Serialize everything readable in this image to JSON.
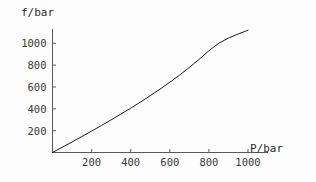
{
  "chart_data": {
    "type": "line",
    "title": "",
    "subtitle": "",
    "xlabel": "P/bar",
    "ylabel": "f/bar",
    "xlim": [
      0,
      1030
    ],
    "ylim": [
      0,
      1150
    ],
    "xticks": [
      200,
      400,
      600,
      800,
      1000
    ],
    "yticks": [
      200,
      400,
      600,
      800,
      1000
    ],
    "xtick_labels": [
      "200",
      "400",
      "600",
      "800",
      "1000"
    ],
    "ytick_labels": [
      "200",
      "400",
      "600",
      "800",
      "1000"
    ],
    "grid": false,
    "legend": null,
    "legend_position": "none",
    "annotations": [],
    "series": [
      {
        "name": "fugacity",
        "color": "#1a1a1a",
        "line_width": 1,
        "x": [
          0,
          50,
          100,
          150,
          200,
          250,
          300,
          350,
          400,
          450,
          500,
          550,
          600,
          650,
          700,
          750,
          800,
          850,
          900,
          950,
          1000
        ],
        "y": [
          0,
          48,
          97,
          146,
          196,
          247,
          299,
          352,
          406,
          462,
          520,
          580,
          643,
          709,
          779,
          853,
          932,
          1000,
          1048,
          1085,
          1120
        ]
      }
    ]
  },
  "axes": {
    "y_axis_label": "f/bar",
    "x_axis_label": "P/bar"
  },
  "colors": {
    "background": "#fdfdfd",
    "axis": "#5a5a5a",
    "curve": "#1a1a1a",
    "text": "#2b2b2b"
  }
}
